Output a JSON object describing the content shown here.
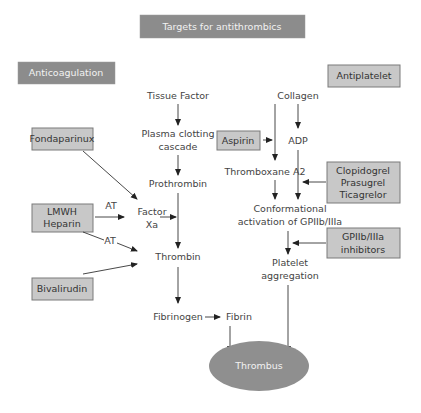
{
  "title": "Targets for antithrombics",
  "sections": {
    "anticoagulation": "Anticoagulation",
    "antiplatelet": "Antiplatelet"
  },
  "coagulation_nodes": {
    "tissue_factor": "Tissue Factor",
    "plasma_cascade_1": "Plasma clotting",
    "plasma_cascade_2": "cascade",
    "prothrombin": "Prothrombin",
    "factor_xa_1": "Factor",
    "factor_xa_2": "Xa",
    "thrombin": "Thrombin",
    "fibrinogen": "Fibrinogen",
    "fibrin": "Fibrin"
  },
  "platelet_nodes": {
    "collagen": "Collagen",
    "adp": "ADP",
    "thromboxane": "Thromboxane A2",
    "conformational_1": "Conformational",
    "conformational_2": "activation of GPIIb/IIIa",
    "platelet_agg_1": "Platelet",
    "platelet_agg_2": "aggregation"
  },
  "outcome": "Thrombus",
  "anticoagulant_drugs": {
    "fondaparinux": "Fondaparinux",
    "lmwh_1": "LMWH",
    "lmwh_2": "Heparin",
    "bivalirudin": "Bivalirudin"
  },
  "antiplatelet_drugs": {
    "aspirin": "Aspirin",
    "p2y12_1": "Clopidogrel",
    "p2y12_2": "Prasugrel",
    "p2y12_3": "Ticagrelor",
    "gp_1": "GPIIb/IIIa",
    "gp_2": "inhibitors"
  },
  "edge_labels": {
    "at_1": "AT",
    "at_2": "AT"
  },
  "colors": {
    "header_box": "#8c8c8c",
    "drug_box": "#c8c8c8",
    "thrombus": "#8f8f8f",
    "arrow": "#333333"
  }
}
